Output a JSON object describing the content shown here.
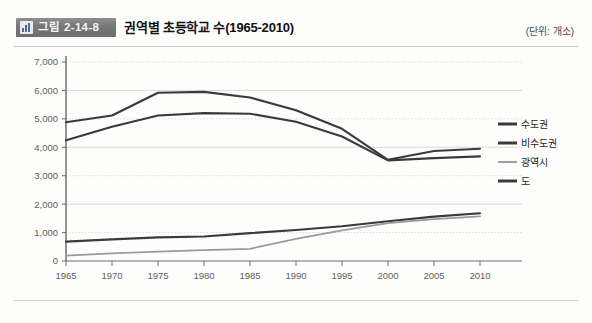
{
  "header": {
    "badge_label": "그림 2-14-8",
    "badge_icon": "bar-chart-icon",
    "title": "권역별 초등학교 수(1965-2010)",
    "unit_note": "(단위: 개소)"
  },
  "chart_data": {
    "type": "line",
    "title": "권역별 초등학교 수(1965-2010)",
    "xlabel": "",
    "ylabel": "",
    "unit": "개소",
    "grid": true,
    "legend_position": "right",
    "xlim": [
      1965,
      2010
    ],
    "ylim": [
      0,
      7000
    ],
    "ytick_labels": [
      "0",
      "1,000",
      "2,000",
      "3,000",
      "4,000",
      "5,000",
      "6,000",
      "7,000"
    ],
    "yticks": [
      0,
      1000,
      2000,
      3000,
      4000,
      5000,
      6000,
      7000
    ],
    "categories": [
      1965,
      1970,
      1975,
      1980,
      1985,
      1990,
      1995,
      2000,
      2005,
      2010
    ],
    "xtick_labels": [
      "1965",
      "1970",
      "1975",
      "1980",
      "1985",
      "1990",
      "1995",
      "2000",
      "2005",
      "2010"
    ],
    "series": [
      {
        "name": "수도권",
        "color": "#3a3a3a",
        "width": 2.1,
        "values": [
          680,
          760,
          830,
          860,
          980,
          1090,
          1220,
          1400,
          1560,
          1680
        ]
      },
      {
        "name": "비수도권",
        "color": "#3a3a3a",
        "width": 2.1,
        "values": [
          4880,
          5120,
          5920,
          5950,
          5750,
          5300,
          4650,
          3560,
          3870,
          3950
        ]
      },
      {
        "name": "광역시",
        "color": "#9a9a9a",
        "width": 1.8,
        "values": [
          190,
          270,
          330,
          380,
          430,
          780,
          1080,
          1330,
          1470,
          1570
        ]
      },
      {
        "name": "도",
        "color": "#3a3a3a",
        "width": 2.1,
        "values": [
          4250,
          4720,
          5120,
          5200,
          5180,
          4900,
          4380,
          3540,
          3620,
          3680
        ]
      }
    ]
  },
  "legend": {
    "items": [
      {
        "label": "수도권",
        "color": "#3a3a3a",
        "width": 3
      },
      {
        "label": "비수도권",
        "color": "#3a3a3a",
        "width": 3
      },
      {
        "label": "광역시",
        "color": "#9e9e9e",
        "width": 2
      },
      {
        "label": "도",
        "color": "#3a3a3a",
        "width": 3
      }
    ]
  }
}
